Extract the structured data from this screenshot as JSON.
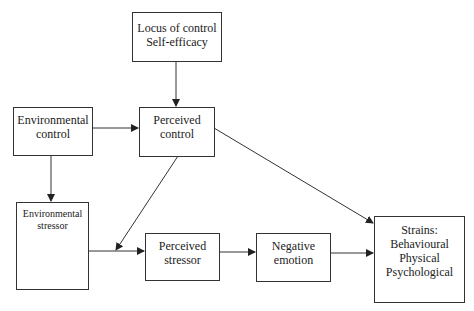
{
  "diagram": {
    "type": "flowchart",
    "nodes": [
      {
        "id": "locus",
        "lines": [
          "Locus of control",
          "Self-efficacy"
        ]
      },
      {
        "id": "env_control",
        "lines": [
          "Environmental",
          "control"
        ]
      },
      {
        "id": "perc_control",
        "lines": [
          "Perceived",
          "control"
        ]
      },
      {
        "id": "env_stressor",
        "lines": [
          "Environmental",
          "stressor"
        ]
      },
      {
        "id": "perc_stressor",
        "lines": [
          "Perceived",
          "stressor"
        ]
      },
      {
        "id": "neg_emotion",
        "lines": [
          "Negative",
          "emotion"
        ]
      },
      {
        "id": "strains",
        "lines": [
          "Strains:",
          "Behavioural",
          "Physical",
          "Psychological"
        ]
      }
    ],
    "edges": [
      {
        "from": "locus",
        "to": "perc_control"
      },
      {
        "from": "env_control",
        "to": "perc_control"
      },
      {
        "from": "env_control",
        "to": "env_stressor"
      },
      {
        "from": "perc_control",
        "to": "strains"
      },
      {
        "from": "perc_control",
        "to": "env_stressor->perc_stressor link"
      },
      {
        "from": "env_stressor",
        "to": "perc_stressor"
      },
      {
        "from": "perc_stressor",
        "to": "neg_emotion"
      },
      {
        "from": "neg_emotion",
        "to": "strains"
      }
    ]
  }
}
